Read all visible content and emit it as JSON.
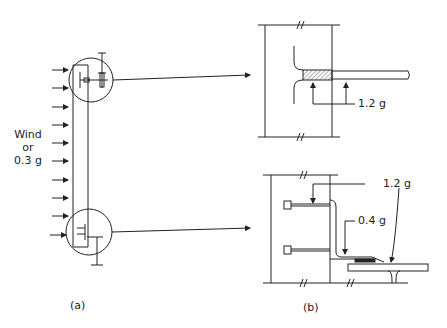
{
  "diagram": {
    "panel_a": {
      "caption": "(a)",
      "load_label": {
        "line1": "Wind",
        "line2": "or",
        "line3": "0.3 g"
      },
      "load_arrow_count": 10
    },
    "panel_b": {
      "caption": "(b)",
      "top_detail": {
        "force_label": "1.2 g"
      },
      "bottom_detail": {
        "force_label_upper": "1.2 g",
        "force_label_lower": "0.4 g"
      }
    },
    "colors": {
      "ink": "#222222",
      "background": "#ffffff"
    }
  }
}
